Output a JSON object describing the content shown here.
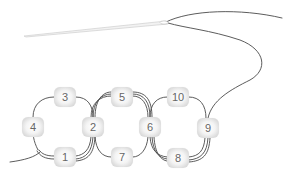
{
  "diagram": {
    "type": "beading-stitch-diagram",
    "colors": {
      "thread": "#4a4a4a",
      "needle": "#cfcfcf",
      "bead_label": "#666666"
    },
    "beads": [
      {
        "label": "1",
        "x": 65,
        "y": 157
      },
      {
        "label": "2",
        "x": 93,
        "y": 127
      },
      {
        "label": "3",
        "x": 65,
        "y": 97
      },
      {
        "label": "4",
        "x": 33,
        "y": 127
      },
      {
        "label": "5",
        "x": 122,
        "y": 97
      },
      {
        "label": "6",
        "x": 150,
        "y": 127
      },
      {
        "label": "7",
        "x": 122,
        "y": 157
      },
      {
        "label": "8",
        "x": 178,
        "y": 158
      },
      {
        "label": "9",
        "x": 208,
        "y": 128
      },
      {
        "label": "10",
        "x": 178,
        "y": 97
      }
    ]
  }
}
